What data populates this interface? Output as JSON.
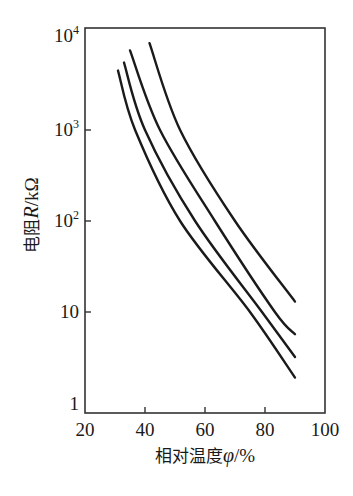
{
  "chart_data": {
    "type": "line",
    "title": "",
    "xlabel": "相对温度φ/%",
    "ylabel": "电阻R/kΩ",
    "xscale": "linear",
    "yscale": "log",
    "xlim": [
      20,
      100
    ],
    "ylim": [
      1,
      10000
    ],
    "xticks": [
      20,
      40,
      60,
      80,
      100
    ],
    "xtick_labels": [
      "20",
      "40",
      "60",
      "80",
      "100"
    ],
    "yticks": [
      1,
      10,
      100,
      1000,
      10000
    ],
    "ytick_labels": [
      "1",
      "10",
      "10²",
      "10³",
      "10⁴"
    ],
    "grid": false,
    "legend": null,
    "series": [
      {
        "name": "curve-1",
        "x": [
          31,
          36.7,
          51.7,
          75,
          90
        ],
        "y": [
          4500,
          1000,
          100,
          10,
          1.9
        ]
      },
      {
        "name": "curve-2",
        "x": [
          33,
          40,
          56.7,
          79,
          90
        ],
        "y": [
          5500,
          1000,
          100,
          10,
          3.2
        ]
      },
      {
        "name": "curve-3",
        "x": [
          35,
          45,
          63.3,
          83.3,
          90
        ],
        "y": [
          7500,
          1000,
          100,
          10,
          5.7
        ]
      },
      {
        "name": "curve-4",
        "x": [
          41.5,
          51.7,
          70,
          90
        ],
        "y": [
          9000,
          1000,
          100,
          13
        ]
      }
    ]
  },
  "labels": {
    "xlabel_prefix": "相对温度",
    "xlabel_var": "φ",
    "xlabel_suffix": "/%",
    "ylabel_prefix": "电阻",
    "ylabel_var": "R",
    "ylabel_suffix": "/kΩ"
  },
  "style": {
    "line_color": "#1a1a1a",
    "axis_color": "#333333"
  }
}
